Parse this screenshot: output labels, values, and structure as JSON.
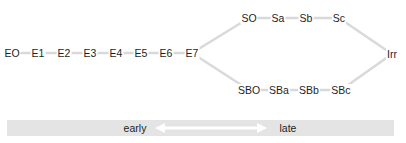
{
  "diagram": {
    "type": "morphological-sequence",
    "edge_color": "#d9d9d9",
    "node_text_color": "#1e1e1e",
    "elliptical_sequence": {
      "nodes": [
        {
          "id": "E0",
          "label": "EO",
          "x": 12,
          "y": 53
        },
        {
          "id": "E1",
          "label": "E1",
          "x": 38,
          "y": 53
        },
        {
          "id": "E2",
          "label": "E2",
          "x": 64,
          "y": 53
        },
        {
          "id": "E3",
          "label": "E3",
          "x": 90,
          "y": 53
        },
        {
          "id": "E4",
          "label": "E4",
          "x": 116,
          "y": 53
        },
        {
          "id": "E5",
          "label": "E5",
          "x": 141,
          "y": 53
        },
        {
          "id": "E6",
          "label": "E6",
          "x": 166,
          "y": 53
        },
        {
          "id": "E7",
          "label": "E7",
          "x": 192,
          "y": 53
        }
      ]
    },
    "spiral_branch": {
      "nodes": [
        {
          "id": "S0",
          "label": "SO",
          "x": 249,
          "y": 18
        },
        {
          "id": "Sa",
          "label": "Sa",
          "x": 278,
          "y": 18
        },
        {
          "id": "Sb",
          "label": "Sb",
          "x": 306,
          "y": 18
        },
        {
          "id": "Sc",
          "label": "Sc",
          "x": 339,
          "y": 18
        }
      ]
    },
    "barred_spiral_branch": {
      "nodes": [
        {
          "id": "SB0",
          "label": "SBO",
          "x": 249,
          "y": 90
        },
        {
          "id": "SBa",
          "label": "SBa",
          "x": 279,
          "y": 90
        },
        {
          "id": "SBb",
          "label": "SBb",
          "x": 309,
          "y": 90
        },
        {
          "id": "SBc",
          "label": "SBc",
          "x": 341,
          "y": 90
        }
      ]
    },
    "irregular": {
      "nodes": [
        {
          "id": "Irr",
          "label": "Irr",
          "x": 392,
          "y": 54
        }
      ]
    },
    "edges": [
      [
        "E0",
        "E1"
      ],
      [
        "E1",
        "E2"
      ],
      [
        "E2",
        "E3"
      ],
      [
        "E3",
        "E4"
      ],
      [
        "E4",
        "E5"
      ],
      [
        "E5",
        "E6"
      ],
      [
        "E6",
        "E7"
      ],
      [
        "E7",
        "S0"
      ],
      [
        "S0",
        "Sa"
      ],
      [
        "Sa",
        "Sb"
      ],
      [
        "Sb",
        "Sc"
      ],
      [
        "Sc",
        "Irr"
      ],
      [
        "E7",
        "SB0"
      ],
      [
        "SB0",
        "SBa"
      ],
      [
        "SBa",
        "SBb"
      ],
      [
        "SBb",
        "SBc"
      ],
      [
        "SBc",
        "Irr"
      ]
    ]
  },
  "timeline": {
    "bar_color": "#e4e4e4",
    "arrow_color": "#ffffff",
    "left_label": "early",
    "right_label": "late"
  }
}
